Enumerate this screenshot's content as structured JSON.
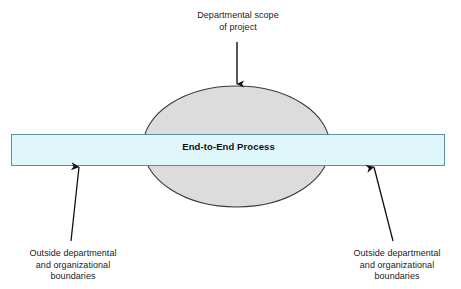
{
  "figure": {
    "type": "process-scope-diagram",
    "background_color": "#ffffff"
  },
  "shapes": {
    "ellipse": {
      "name": "departmental-scope-ellipse",
      "fill_color": "#dcdcdc",
      "stroke_color": "#3a3a3a",
      "cx": 236.5,
      "cy": 146.5,
      "rx": 93.5,
      "ry": 60.5
    },
    "bar": {
      "name": "end-to-end-process-bar",
      "label": "End-to-End Process",
      "fill_color": "#dff7fb",
      "stroke_color": "#5b8fa8",
      "x": 11,
      "y": 134,
      "width": 434,
      "height": 32
    }
  },
  "annotations": {
    "top": {
      "text": "Departmental scope\nof project",
      "arrow": {
        "name": "arrow-to-ellipse",
        "from_x": 237,
        "from_y": 42,
        "to_x": 237,
        "to_y": 86,
        "color": "#222222"
      }
    },
    "bottom_left": {
      "text": "Outside departmental\nand organizational\nboundaries",
      "arrow": {
        "name": "arrow-to-bar-left",
        "from_x": 71,
        "from_y": 240,
        "to_x": 79,
        "to_y": 165,
        "color": "#111111"
      }
    },
    "bottom_right": {
      "text": "Outside departmental\nand organizational\nboundaries",
      "arrow": {
        "name": "arrow-to-bar-right",
        "from_x": 393,
        "from_y": 240,
        "to_x": 374,
        "to_y": 165,
        "color": "#111111"
      }
    }
  },
  "colors": {
    "ellipse_fill": "#dcdcdc",
    "ellipse_stroke": "#3a3a3a",
    "bar_fill": "#dff7fb",
    "bar_stroke": "#5b8fa8",
    "text": "#1a1a1a",
    "arrow": "#111111"
  }
}
